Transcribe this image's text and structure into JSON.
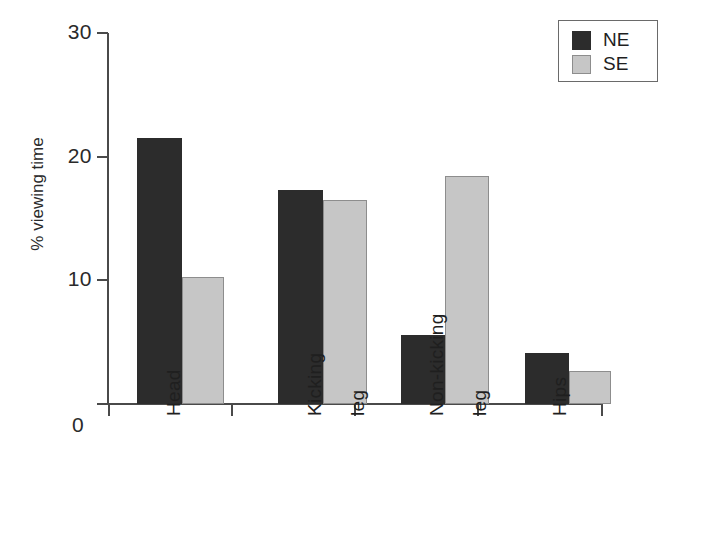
{
  "chart_data": {
    "type": "bar",
    "title": "",
    "xlabel": "",
    "ylabel": "% viewing time",
    "ylim": [
      0,
      30
    ],
    "yticks": [
      0,
      10,
      20,
      30
    ],
    "grid": false,
    "legend_position": "top-right",
    "categories": [
      "Head",
      "Kicking leg",
      "Non-kicking leg",
      "Hips"
    ],
    "category_label_lines": [
      [
        "Head"
      ],
      [
        "Kicking",
        "leg"
      ],
      [
        "Non-kicking",
        "leg"
      ],
      [
        "Hips"
      ]
    ],
    "series": [
      {
        "name": "NE",
        "color": "#2c2c2c",
        "values": [
          21.5,
          17.3,
          5.6,
          4.1
        ]
      },
      {
        "name": "SE",
        "color": "#c6c6c6",
        "values": [
          10.3,
          16.5,
          18.4,
          2.7
        ]
      }
    ],
    "origin_label": "0"
  },
  "axis": {
    "y_ticks": [
      {
        "value": 30,
        "label": "30"
      },
      {
        "value": 20,
        "label": "20"
      },
      {
        "value": 10,
        "label": "10"
      },
      {
        "value": 0,
        "label": "0"
      }
    ],
    "y_title": "% viewing time",
    "origin_label": "0"
  },
  "legend": {
    "items": [
      {
        "label": "NE",
        "color": "#2c2c2c"
      },
      {
        "label": "SE",
        "color": "#c6c6c6"
      }
    ]
  },
  "bars": [
    {
      "group": "Head",
      "series": "NE",
      "value": 21.5,
      "left": 30,
      "width": 45
    },
    {
      "group": "Head",
      "series": "SE",
      "value": 10.3,
      "left": 75,
      "width": 42
    },
    {
      "group": "Kicking leg",
      "series": "NE",
      "value": 17.3,
      "left": 171,
      "width": 45
    },
    {
      "group": "Kicking leg",
      "series": "SE",
      "value": 16.5,
      "left": 216,
      "width": 44
    },
    {
      "group": "Non-kicking leg",
      "series": "NE",
      "value": 5.6,
      "left": 294,
      "width": 44
    },
    {
      "group": "Non-kicking leg",
      "series": "SE",
      "value": 18.4,
      "left": 338,
      "width": 44
    },
    {
      "group": "Hips",
      "series": "NE",
      "value": 4.1,
      "left": 418,
      "width": 44
    },
    {
      "group": "Hips",
      "series": "SE",
      "value": 2.7,
      "left": 462,
      "width": 42
    }
  ],
  "x_ticks": [
    108,
    231,
    354,
    477,
    601
  ],
  "x_labels": [
    {
      "text": "Head",
      "x": 164,
      "y": 416
    },
    {
      "text": "Kicking",
      "x": 305,
      "y": 416
    },
    {
      "text": "leg",
      "x": 348,
      "y": 416
    },
    {
      "text": "Non-kicking",
      "x": 427,
      "y": 416
    },
    {
      "text": "leg",
      "x": 470,
      "y": 416
    },
    {
      "text": "Hips",
      "x": 550,
      "y": 416
    }
  ]
}
